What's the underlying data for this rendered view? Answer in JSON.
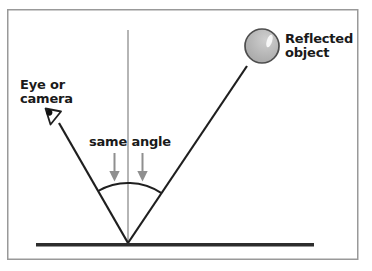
{
  "diagram": {
    "eye_label": {
      "line1": "Eye or",
      "line2": "camera"
    },
    "object_label": {
      "line1": "Reflected",
      "line2": "object"
    },
    "angle_label": "same angle"
  },
  "colors": {
    "background": "#ffffff",
    "frame_border": "#999999",
    "ray": "#1f1f1f",
    "normal_line": "#b5b5b5",
    "arc": "#1f1f1f",
    "arrow": "#8f8f8f",
    "surface": "#2d2d2d",
    "text": "#1a1a1a",
    "sphere_light": "#cfcfcf",
    "sphere_fill": "#b3b3b3",
    "sphere_dark": "#9e9e9e",
    "sphere_outline": "#4d4d4d",
    "sphere_highlight": "#f7f7f7",
    "eye_icon_fill": "#ffffff",
    "eye_icon_pupil": "#111111"
  }
}
